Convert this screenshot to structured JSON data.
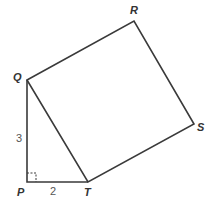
{
  "diagram": {
    "stroke_color": "#3a3a3a",
    "points": {
      "Q": {
        "label": "Q",
        "x": 27,
        "y": 80
      },
      "R": {
        "label": "R",
        "x": 134,
        "y": 21
      },
      "S": {
        "label": "S",
        "x": 194,
        "y": 124
      },
      "T": {
        "label": "T",
        "x": 88,
        "y": 182
      },
      "P": {
        "label": "P",
        "x": 27,
        "y": 182
      }
    },
    "lengths": {
      "PQ": "3",
      "PT": "2"
    },
    "right_angle_at": "P"
  }
}
